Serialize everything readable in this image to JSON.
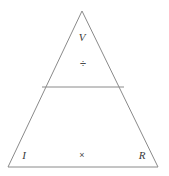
{
  "diagram": {
    "kind": "ohms-law-triangle",
    "background_color": "#ffffff",
    "stroke_color": "#8a8a8a",
    "text_color": "#3a3a3a",
    "stroke_width": 1,
    "canvas": {
      "width": 169,
      "height": 176
    },
    "geometry": {
      "apex": {
        "x": 82,
        "y": 11
      },
      "bottom_left": {
        "x": 8,
        "y": 167
      },
      "bottom_right": {
        "x": 158,
        "y": 167
      },
      "divider_left": {
        "x": 42,
        "y": 87
      },
      "divider_right": {
        "x": 124,
        "y": 87
      }
    },
    "top_cell": {
      "variable_label": "V",
      "operator_label": "÷",
      "operator_name": "division-sign"
    },
    "bottom_cell": {
      "left_label": "I",
      "right_label": "R",
      "operator_label": "×",
      "operator_name": "multiplication-sign"
    }
  }
}
